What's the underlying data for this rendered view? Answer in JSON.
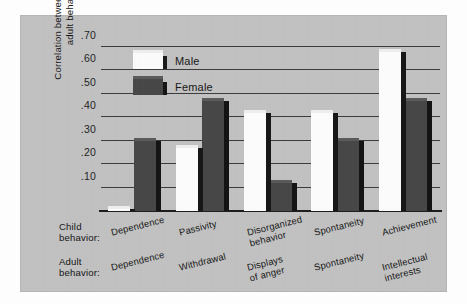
{
  "chart_data": {
    "type": "bar",
    "title": "",
    "subtitle": "",
    "xlabel": "",
    "ylabel": "Correlation between child\nand adult behavior",
    "ylim": [
      0.0,
      0.7
    ],
    "ytick_labels": [
      ".70",
      ".60",
      ".50",
      ".40",
      ".30",
      ".20",
      ".10"
    ],
    "ytick_values": [
      0.7,
      0.6,
      0.5,
      0.4,
      0.3,
      0.2,
      0.1
    ],
    "grid": true,
    "legend_position": "top-left-inside",
    "categories": [
      "Dependence",
      "Passivity",
      "Disorganized behavior",
      "Spontaneity",
      "Achievement"
    ],
    "child_behavior": [
      "Dependence",
      "Passivity",
      "Disorganized\nbehavior",
      "Spontaneity",
      "Achievement"
    ],
    "adult_behavior": [
      "Dependence",
      "Withdrawal",
      "Displays\nof anger",
      "Spontaneity",
      "Intellectual\ninterests"
    ],
    "series": [
      {
        "name": "Male",
        "color": "#fbfbfb",
        "values": [
          0.01,
          0.27,
          0.42,
          0.42,
          0.68
        ]
      },
      {
        "name": "Female",
        "color": "#474747",
        "values": [
          0.3,
          0.47,
          0.12,
          0.3,
          0.47
        ]
      }
    ]
  },
  "axis_titles": {
    "child_row": "Child\nbehavior:",
    "adult_row": "Adult\nbehavior:"
  },
  "legend": {
    "items": [
      {
        "label": "Male",
        "swatch": "male-swatch"
      },
      {
        "label": "Female",
        "swatch": "female-swatch"
      }
    ]
  },
  "colors": {
    "panel_background": "#c2c2c2",
    "page_background": "#fdfdfd",
    "gridline": "#3b3b3b",
    "baseline": "#1c1c1c",
    "male_bar": "#fbfbfb",
    "female_bar": "#474747",
    "bar_shadow": "#171717",
    "text": "#161616"
  }
}
